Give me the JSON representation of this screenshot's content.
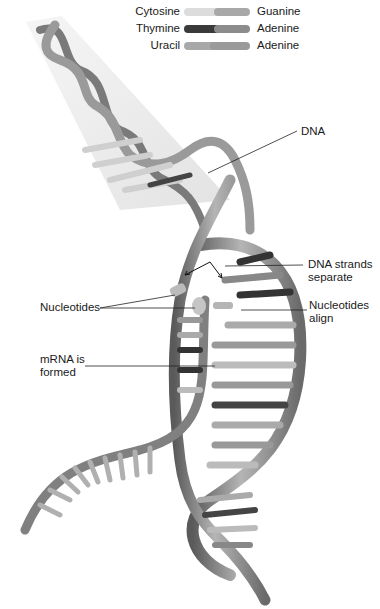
{
  "legend": {
    "rows": [
      {
        "left": "Cytosine",
        "right": "Guanine",
        "left_color": "#d8d8d8",
        "right_color": "#a8a8a8"
      },
      {
        "left": "Thymine",
        "right": "Adenine",
        "left_color": "#3a3a3a",
        "right_color": "#8a8a8a"
      },
      {
        "left": "Uracil",
        "right": "Adenine",
        "left_color": "#a0a0a0",
        "right_color": "#9a9a9a"
      }
    ]
  },
  "labels": {
    "dna": "DNA",
    "dna_strands_separate_1": "DNA strands",
    "dna_strands_separate_2": "separate",
    "nucleotides_left": "Nucleotides",
    "nucleotides_align_1": "Nucleotides",
    "nucleotides_align_2": "align",
    "mrna_formed_1": "mRNA is",
    "mrna_formed_2": "formed"
  },
  "colors": {
    "backbone": "#8c8c8c",
    "backbone_dark": "#555555",
    "cone": "#e6e6e6",
    "leader": "#222222"
  }
}
